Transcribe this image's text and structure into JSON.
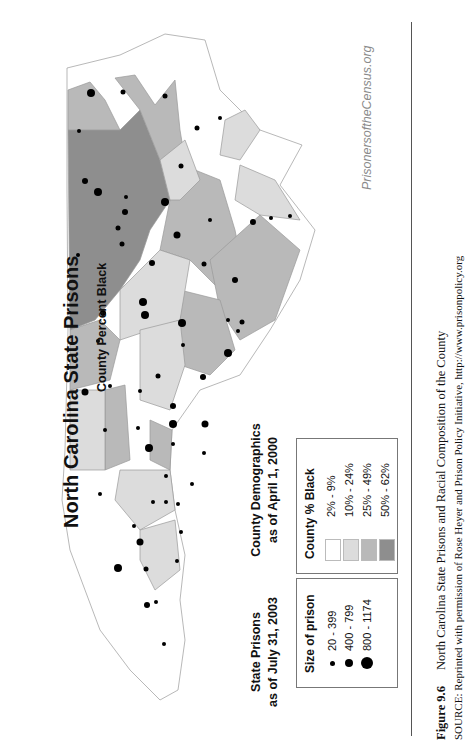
{
  "figure": {
    "title": "North Carolina State Prisons",
    "subtitle": "County Percent Black",
    "watermark": "PrisonersoftheCensus.org",
    "orientation": "rotated 90° counter-clockwise on page"
  },
  "legend_demographics": {
    "heading_line1": "County Demographics",
    "heading_line2": "as of April 1, 2000",
    "box_title": "County % Black",
    "items": [
      {
        "label": "2% - 9%",
        "color": "#ffffff"
      },
      {
        "label": "10% - 24%",
        "color": "#dcdcdc"
      },
      {
        "label": "25% - 49%",
        "color": "#b9b9b9"
      },
      {
        "label": "50% - 62%",
        "color": "#8e8e8e"
      }
    ]
  },
  "legend_prisons": {
    "heading_line1": "State Prisons",
    "heading_line2": "as of July 31, 2003",
    "box_title": "Size of prison",
    "items": [
      {
        "label": "20 - 399",
        "size": 5
      },
      {
        "label": "400 - 799",
        "size": 8
      },
      {
        "label": "800 - 1174",
        "size": 12
      }
    ]
  },
  "caption": {
    "figure_number": "Figure 9.6",
    "text": "North Carolina State Prisons and Racial Composition of the County",
    "source": "SOURCE: Reprinted with permission of Rose Heyer and Prison Policy Initiative, http://www.prisonpolicy.org"
  },
  "colors": {
    "shade_2_9": "#ffffff",
    "shade_10_24": "#dcdcdc",
    "shade_25_49": "#b9b9b9",
    "shade_50_62": "#8e8e8e",
    "county_border": "#999999",
    "prison_dot": "#000000"
  }
}
